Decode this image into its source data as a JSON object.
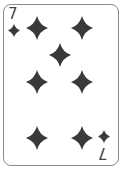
{
  "card": {
    "rank": "7",
    "suit": "diamonds",
    "suit_icon": "diamond-icon",
    "pip_color": "#3a3a3a",
    "border_color": "#8a8a8a",
    "pips": [
      {
        "x": 37,
        "y": 28
      },
      {
        "x": 82,
        "y": 28
      },
      {
        "x": 60,
        "y": 55
      },
      {
        "x": 37,
        "y": 82
      },
      {
        "x": 82,
        "y": 82
      },
      {
        "x": 37,
        "y": 138
      },
      {
        "x": 82,
        "y": 138
      }
    ]
  }
}
